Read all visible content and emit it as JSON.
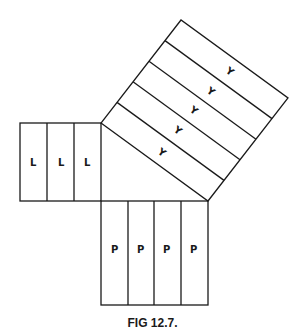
{
  "figure": {
    "caption": "FIG 12.7.",
    "left_square": {
      "strip_label": "L",
      "strip_count": 3,
      "labels": [
        "L",
        "L",
        "L"
      ]
    },
    "bottom_square": {
      "strip_label": "P",
      "strip_count": 4,
      "labels": [
        "P",
        "P",
        "P",
        "P"
      ]
    },
    "hypotenuse_square": {
      "strip_label": "Y",
      "strip_count": 5,
      "labels": [
        "Y",
        "Y",
        "Y",
        "Y",
        "Y"
      ]
    },
    "line_color": "#1a1a1a",
    "background": "#ffffff"
  }
}
